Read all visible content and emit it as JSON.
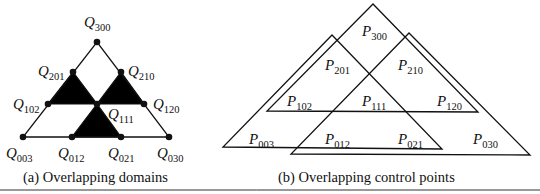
{
  "panel_a": {
    "caption": "(a)  Overlapping domains",
    "outer_triangle": [
      "Q003",
      "Q030",
      "Q300"
    ],
    "shaded_triangles": [
      [
        "Q201",
        "Q102",
        "Q111"
      ],
      [
        "Q210",
        "Q111",
        "Q120"
      ],
      [
        "Q111",
        "Q012",
        "Q021"
      ]
    ],
    "points": [
      {
        "id": "Q300",
        "base": "Q",
        "sub": "300",
        "x": 97,
        "y": 42,
        "lx": 84,
        "ly": 27,
        "anchor": "start"
      },
      {
        "id": "Q201",
        "base": "Q",
        "sub": "201",
        "x": 73,
        "y": 72,
        "lx": 38,
        "ly": 76,
        "anchor": "start"
      },
      {
        "id": "Q210",
        "base": "Q",
        "sub": "210",
        "x": 121,
        "y": 72,
        "lx": 128,
        "ly": 76,
        "anchor": "start"
      },
      {
        "id": "Q102",
        "base": "Q",
        "sub": "102",
        "x": 48,
        "y": 104,
        "lx": 13,
        "ly": 109,
        "anchor": "start"
      },
      {
        "id": "Q111",
        "base": "Q",
        "sub": "111",
        "x": 97,
        "y": 104,
        "lx": 108,
        "ly": 119,
        "anchor": "start"
      },
      {
        "id": "Q120",
        "base": "Q",
        "sub": "120",
        "x": 144,
        "y": 104,
        "lx": 153,
        "ly": 109,
        "anchor": "start"
      },
      {
        "id": "Q003",
        "base": "Q",
        "sub": "003",
        "x": 23,
        "y": 137,
        "lx": 6,
        "ly": 158,
        "anchor": "start"
      },
      {
        "id": "Q012",
        "base": "Q",
        "sub": "012",
        "x": 72,
        "y": 137,
        "lx": 58,
        "ly": 158,
        "anchor": "start"
      },
      {
        "id": "Q021",
        "base": "Q",
        "sub": "021",
        "x": 121,
        "y": 137,
        "lx": 108,
        "ly": 158,
        "anchor": "start"
      },
      {
        "id": "Q030",
        "base": "Q",
        "sub": "030",
        "x": 169,
        "y": 137,
        "lx": 157,
        "ly": 158,
        "anchor": "start"
      }
    ]
  },
  "panel_b": {
    "caption": "(b)  Overlapping control points",
    "triangles": [
      {
        "name": "top-triangle",
        "points": "373,4 267,111 478,112"
      },
      {
        "name": "left-triangle",
        "points": "332,35 223,147 442,149"
      },
      {
        "name": "right-triangle",
        "points": "409,33 291,154 530,155"
      }
    ],
    "labels": [
      {
        "base": "P",
        "sub": "300",
        "x": 362,
        "y": 36
      },
      {
        "base": "P",
        "sub": "201",
        "x": 325,
        "y": 70
      },
      {
        "base": "P",
        "sub": "210",
        "x": 398,
        "y": 70
      },
      {
        "base": "P",
        "sub": "102",
        "x": 287,
        "y": 106
      },
      {
        "base": "P",
        "sub": "111",
        "x": 362,
        "y": 106
      },
      {
        "base": "P",
        "sub": "120",
        "x": 437,
        "y": 106
      },
      {
        "base": "P",
        "sub": "003",
        "x": 249,
        "y": 144
      },
      {
        "base": "P",
        "sub": "012",
        "x": 325,
        "y": 144
      },
      {
        "base": "P",
        "sub": "021",
        "x": 398,
        "y": 144
      },
      {
        "base": "P",
        "sub": "030",
        "x": 473,
        "y": 144
      }
    ]
  },
  "style": {
    "line_color": "#111111",
    "fill_color": "#000000",
    "background": "#ffffff"
  }
}
